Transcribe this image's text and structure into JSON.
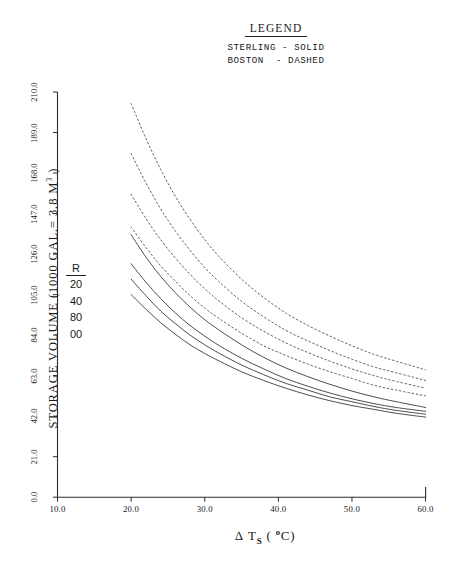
{
  "legend": {
    "title": "LEGEND",
    "lines": [
      "STERLING - SOLID",
      "BOSTON  - DASHED"
    ]
  },
  "axes": {
    "y_title_main": "STORAGE VOLUME (1000 GAL.= 3.8 M",
    "y_title_sup": "3",
    "y_title_close": " )",
    "x_title_delta": "Δ",
    "x_title_t": "T",
    "x_title_sub": "S",
    "x_title_open": " ( ",
    "x_title_deg": "o",
    "x_title_c": "C)",
    "y_ticks": [
      "0.0",
      "21.0",
      "42.0",
      "63.0",
      "84.0",
      "105.0",
      "126.0",
      "147.0",
      "168.0",
      "189.0",
      "210.0"
    ],
    "x_ticks": [
      "10.0",
      "20.0",
      "30.0",
      "40.0",
      "50.0",
      "60.0"
    ]
  },
  "r_parameter": {
    "header": "R",
    "values": [
      "20",
      "40",
      "80",
      "00"
    ]
  },
  "chart_data": {
    "type": "line",
    "title": "",
    "xlabel": "Δ Ts ( °C)",
    "ylabel": "STORAGE VOLUME (1000 GAL.= 3.8 M3)",
    "xlim": [
      10.0,
      60.0
    ],
    "ylim": [
      0.0,
      210.0
    ],
    "grid": false,
    "legend_position": "top-center",
    "x": [
      20,
      22,
      24,
      26,
      28,
      30,
      32,
      35,
      38,
      41,
      44,
      47,
      50,
      53,
      56,
      60
    ],
    "series": [
      {
        "name": "Boston R-20",
        "style": "dashed",
        "color": "#333333",
        "values": [
          204.0,
          186.0,
          170.0,
          156.0,
          144.0,
          133.5,
          124.5,
          113.0,
          103.5,
          95.5,
          89.0,
          83.5,
          78.5,
          74.0,
          70.5,
          66.0
        ]
      },
      {
        "name": "Boston R-40",
        "style": "dashed",
        "color": "#333333",
        "values": [
          178.0,
          163.0,
          149.5,
          138.0,
          128.0,
          119.0,
          111.5,
          101.5,
          93.5,
          86.5,
          81.0,
          76.0,
          71.5,
          67.5,
          64.5,
          60.5
        ]
      },
      {
        "name": "Boston R-80",
        "style": "dashed",
        "color": "#333333",
        "values": [
          157.0,
          144.5,
          133.5,
          124.0,
          115.5,
          108.0,
          101.5,
          93.0,
          86.0,
          80.0,
          75.0,
          70.5,
          66.5,
          63.0,
          60.0,
          56.5
        ]
      },
      {
        "name": "Boston R-00",
        "style": "dashed",
        "color": "#333333",
        "values": [
          140.0,
          129.5,
          120.0,
          112.0,
          104.5,
          98.0,
          92.5,
          85.0,
          78.5,
          73.5,
          69.0,
          65.0,
          61.5,
          58.0,
          55.5,
          52.5
        ]
      },
      {
        "name": "Sterling R-20",
        "style": "solid",
        "color": "#2a2a2a",
        "values": [
          136.0,
          124.5,
          114.5,
          106.0,
          98.5,
          92.0,
          86.5,
          79.0,
          72.5,
          67.0,
          62.5,
          58.5,
          55.0,
          52.0,
          49.5,
          46.5
        ]
      },
      {
        "name": "Sterling R-40",
        "style": "solid",
        "color": "#2a2a2a",
        "values": [
          121.0,
          111.5,
          103.0,
          95.5,
          89.0,
          83.5,
          78.5,
          72.0,
          66.5,
          61.5,
          57.5,
          54.0,
          51.0,
          48.5,
          46.5,
          44.5
        ]
      },
      {
        "name": "Sterling R-80",
        "style": "solid",
        "color": "#2a2a2a",
        "values": [
          113.0,
          104.5,
          96.5,
          90.0,
          84.0,
          79.0,
          74.5,
          68.5,
          63.5,
          59.0,
          55.5,
          52.0,
          49.5,
          47.0,
          45.0,
          43.0
        ]
      },
      {
        "name": "Sterling R-00",
        "style": "solid",
        "color": "#2a2a2a",
        "values": [
          105.0,
          97.5,
          90.5,
          84.5,
          79.0,
          74.5,
          70.5,
          65.0,
          60.5,
          56.5,
          53.0,
          50.0,
          47.5,
          45.5,
          43.5,
          41.5
        ]
      }
    ]
  }
}
